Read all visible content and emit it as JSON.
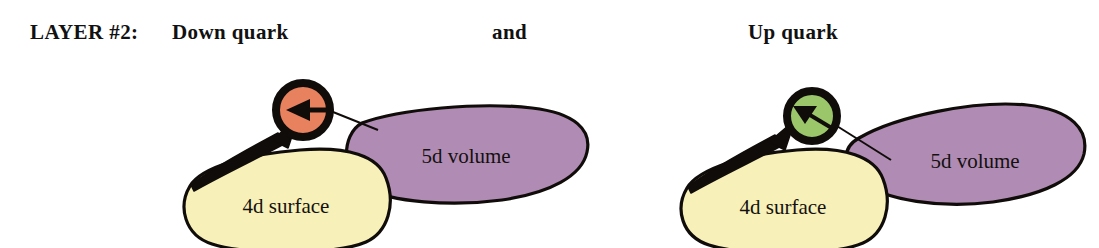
{
  "figure": {
    "background_color": "#ffffff",
    "header": {
      "layer_label": "LAYER #2:",
      "left_title": "Down quark",
      "conjunction": "and",
      "right_title": "Up quark"
    },
    "palette": {
      "down_quark_fill": "#e8815e",
      "up_quark_fill": "#9bc66a",
      "surface_fill": "#f7f0b8",
      "volume_fill": "#b08cb4",
      "outline": "#100c0a",
      "text": "#14100f"
    },
    "diagrams": [
      {
        "id": "down-quark-diagram",
        "quark": {
          "name": "down-quark",
          "fill": "#e8815e",
          "arrow_direction": "left",
          "ring_color": "#100c0a"
        },
        "surface": {
          "label": "4d surface",
          "fill": "#f7f0b8"
        },
        "volume": {
          "label": "5d volume",
          "fill": "#b08cb4"
        },
        "connectors": [
          {
            "name": "surface-to-quark",
            "style": "arrow"
          },
          {
            "name": "volume-to-quark",
            "style": "line"
          }
        ]
      },
      {
        "id": "up-quark-diagram",
        "quark": {
          "name": "up-quark",
          "fill": "#9bc66a",
          "arrow_direction": "left",
          "ring_color": "#100c0a"
        },
        "surface": {
          "label": "4d surface",
          "fill": "#f7f0b8"
        },
        "volume": {
          "label": "5d volume",
          "fill": "#b08cb4"
        },
        "connectors": [
          {
            "name": "surface-to-quark",
            "style": "arrow"
          },
          {
            "name": "volume-to-quark",
            "style": "line"
          }
        ]
      }
    ]
  }
}
